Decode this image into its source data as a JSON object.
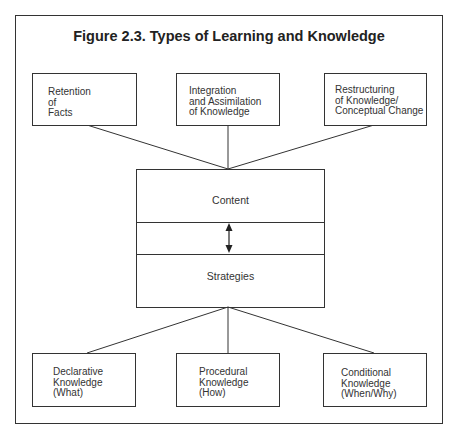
{
  "figure": {
    "title": "Figure 2.3. Types of Learning and Knowledge",
    "top_boxes": [
      {
        "label": "Retention\nof\nFacts"
      },
      {
        "label": "Integration\nand Assimilation\nof Knowledge"
      },
      {
        "label": "Restructuring\nof Knowledge/\nConceptual Change"
      }
    ],
    "center": {
      "top_label": "Content",
      "bottom_label": "Strategies",
      "connector": "double-arrow-vertical"
    },
    "bottom_boxes": [
      {
        "label": "Declarative\nKnowledge\n(What)"
      },
      {
        "label": "Procedural\nKnowledge\n(How)"
      },
      {
        "label": "Conditional\nKnowledge\n(When/Why)"
      }
    ]
  }
}
